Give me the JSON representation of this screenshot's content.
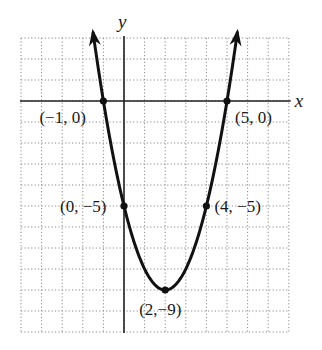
{
  "chart_data": {
    "type": "line",
    "title": "",
    "xlabel": "x",
    "ylabel": "y",
    "equation": "y = x^2 - 4x - 5",
    "xlim": [
      -5,
      8
    ],
    "ylim": [
      -11,
      3
    ],
    "grid": true,
    "grid_style": "dotted",
    "legend": null,
    "series": [
      {
        "name": "parabola",
        "function": "x^2 - 4x - 5",
        "x_range": [
          -1.5,
          5.5
        ],
        "arrows": "both ends",
        "color": "#111111"
      }
    ],
    "points": [
      {
        "x": -1,
        "y": 0,
        "label": "(−1, 0)"
      },
      {
        "x": 5,
        "y": 0,
        "label": "(5, 0)"
      },
      {
        "x": 0,
        "y": -5,
        "label": "(0, −5)"
      },
      {
        "x": 4,
        "y": -5,
        "label": "(4, −5)"
      },
      {
        "x": 2,
        "y": -9,
        "label": "(2,−9)"
      }
    ]
  },
  "axes": {
    "x_label": "x",
    "y_label": "y"
  },
  "colors": {
    "curve": "#111111",
    "axis": "#222222",
    "grid": "#8a8a8a"
  }
}
